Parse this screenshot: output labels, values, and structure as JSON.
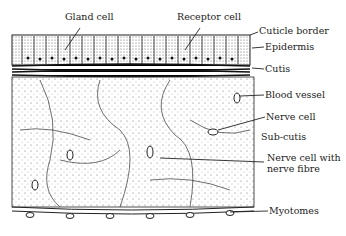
{
  "labels": {
    "gland_cell": "Gland cell",
    "receptor_cell": "Receptor cell",
    "cuticle_border": "Cuticle border",
    "epidermis": "Epidermis",
    "cutis": "Cutis",
    "blood_vessel": "Blood vessel",
    "nerve_cell": "Nerve cell",
    "sub_cutis": "Sub-cutis",
    "nerve_cell_with_fibre_1": "Nerve cell with",
    "nerve_cell_with_fibre_2": "nerve fibre",
    "myotomes": "Myotomes"
  }
}
